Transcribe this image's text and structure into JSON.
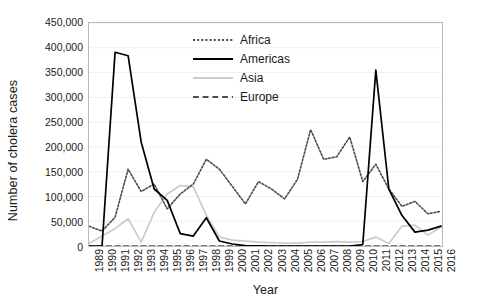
{
  "chart_data": {
    "type": "line",
    "title": "",
    "xlabel": "Year",
    "ylabel": "Number of cholera cases",
    "grid": true,
    "legend_position": "top-center-inside",
    "xlim": [
      1989,
      2016
    ],
    "ylim": [
      0,
      450000
    ],
    "ytick_step": 50000,
    "categories": [
      "1989",
      "1990",
      "1991",
      "1992",
      "1993",
      "1994",
      "1995",
      "1996",
      "1997",
      "1998",
      "1999",
      "2000",
      "2001",
      "2002",
      "2003",
      "2004",
      "2005",
      "2006",
      "2007",
      "2008",
      "2009",
      "2010",
      "2011",
      "2012",
      "2013",
      "2014",
      "2015",
      "2016"
    ],
    "ytick_labels": [
      "0",
      "50,000",
      "100,000",
      "150,000",
      "200,000",
      "250,000",
      "300,000",
      "350,000",
      "400,000",
      "450,000"
    ],
    "ytick_values": [
      0,
      50000,
      100000,
      150000,
      200000,
      250000,
      300000,
      350000,
      400000,
      450000
    ],
    "series": [
      {
        "name": "Africa",
        "style": "dotted",
        "color": "#4d4d4d",
        "values": [
          40000,
          30000,
          58000,
          155000,
          110000,
          125000,
          75000,
          105000,
          125000,
          175000,
          155000,
          120000,
          85000,
          130000,
          115000,
          95000,
          135000,
          235000,
          175000,
          180000,
          220000,
          130000,
          165000,
          115000,
          80000,
          90000,
          65000,
          70000
        ]
      },
      {
        "name": "Americas",
        "style": "solid",
        "color": "#000000",
        "values": [
          0,
          0,
          391000,
          384000,
          210000,
          115000,
          92000,
          25000,
          20000,
          57000,
          10000,
          4000,
          700,
          100,
          30,
          30,
          25,
          20,
          15,
          10,
          5,
          3000,
          355000,
          115000,
          62000,
          28000,
          32000,
          40000
        ]
      },
      {
        "name": "Asia",
        "style": "solid",
        "color": "#cccccc",
        "values": [
          5000,
          20000,
          35000,
          55000,
          8000,
          68000,
          105000,
          122000,
          120000,
          62000,
          18000,
          12000,
          10000,
          8000,
          7000,
          6000,
          6000,
          8000,
          8000,
          9000,
          8000,
          9000,
          18000,
          5000,
          40000,
          42000,
          22000,
          38000
        ]
      },
      {
        "name": "Europe",
        "style": "dashed",
        "color": "#4d4d4d",
        "values": [
          0,
          0,
          0,
          0,
          0,
          0,
          0,
          0,
          0,
          0,
          0,
          0,
          0,
          0,
          0,
          0,
          0,
          0,
          0,
          0,
          0,
          0,
          0,
          0,
          0,
          0,
          0,
          0
        ]
      }
    ]
  },
  "legend": {
    "items": [
      {
        "label": "Africa"
      },
      {
        "label": "Americas"
      },
      {
        "label": "Asia"
      },
      {
        "label": "Europe"
      }
    ]
  }
}
